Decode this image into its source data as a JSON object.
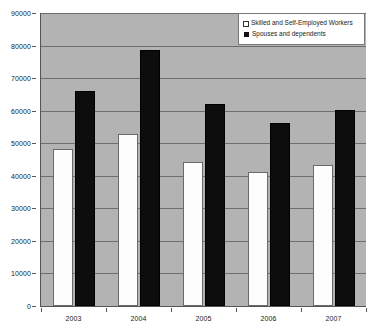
{
  "chart_data": {
    "type": "bar",
    "title": "",
    "subtitle": "",
    "xlabel": "",
    "ylabel": "",
    "categories": [
      "2003",
      "2004",
      "2005",
      "2006",
      "2007"
    ],
    "series": [
      {
        "name": "Skilled and Self-Employed Workers",
        "color": "#ffffff",
        "values": [
          48200,
          52700,
          44200,
          41200,
          43300
        ]
      },
      {
        "name": "Spouses and dependents",
        "color": "#111111",
        "values": [
          66000,
          78700,
          62100,
          56300,
          60200
        ]
      }
    ],
    "ylim": [
      0,
      90000
    ],
    "ytick_step": 10000,
    "yticks": [
      0,
      10000,
      20000,
      30000,
      40000,
      50000,
      60000,
      70000,
      80000,
      90000
    ],
    "ytick_labels": [
      "0",
      "10000",
      "20000",
      "30000",
      "40000",
      "50000",
      "60000",
      "70000",
      "80000",
      "90000"
    ],
    "grid": true,
    "grid_axis": "y",
    "legend_position": "top-right",
    "plot_background": "#b3b3b3",
    "figure_background": "#ffffff"
  },
  "legend": {
    "entries": [
      {
        "label": "Skilled and Self-Employed Workers",
        "marker": "open-square-marker"
      },
      {
        "label": "Spouses and dependents",
        "marker": "filled-square-marker"
      }
    ]
  }
}
